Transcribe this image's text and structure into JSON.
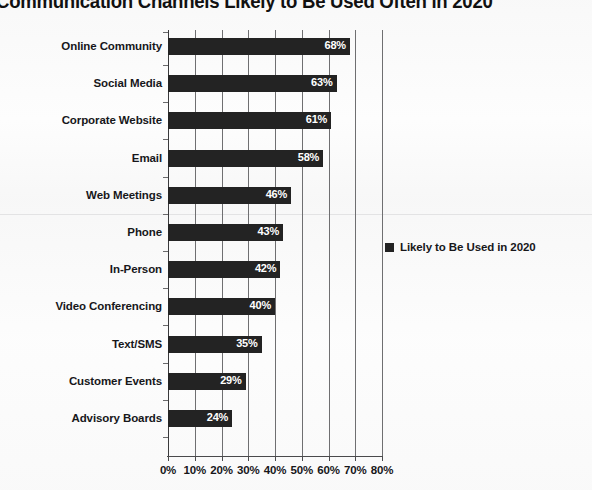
{
  "chart_data": {
    "type": "bar",
    "orientation": "horizontal",
    "title": "Communication Channels Likely to Be Used Often in 2020",
    "xlabel": "",
    "ylabel": "",
    "xlim": [
      0,
      80
    ],
    "grid": true,
    "legend_position": "right",
    "series": [
      {
        "name": "Likely to Be Used in 2020",
        "color": "#232323",
        "values": [
          68,
          63,
          61,
          58,
          46,
          43,
          42,
          40,
          35,
          29,
          24
        ]
      }
    ],
    "categories": [
      "Online Community",
      "Social Media",
      "Corporate Website",
      "Email",
      "Web Meetings",
      "Phone",
      "In-Person",
      "Video Conferencing",
      "Text/SMS",
      "Customer Events",
      "Advisory Boards"
    ],
    "data_labels": [
      "68%",
      "63%",
      "61%",
      "58%",
      "46%",
      "43%",
      "42%",
      "40%",
      "35%",
      "29%",
      "24%"
    ],
    "xticks": [
      0,
      10,
      20,
      30,
      40,
      50,
      60,
      70,
      80
    ],
    "xtick_labels": [
      "0%",
      "10%",
      "20%",
      "30%",
      "40%",
      "50%",
      "60%",
      "70%",
      "80%"
    ]
  },
  "legend": {
    "entries": [
      {
        "label": "Likely to Be Used in 2020",
        "color": "#232323"
      }
    ]
  }
}
